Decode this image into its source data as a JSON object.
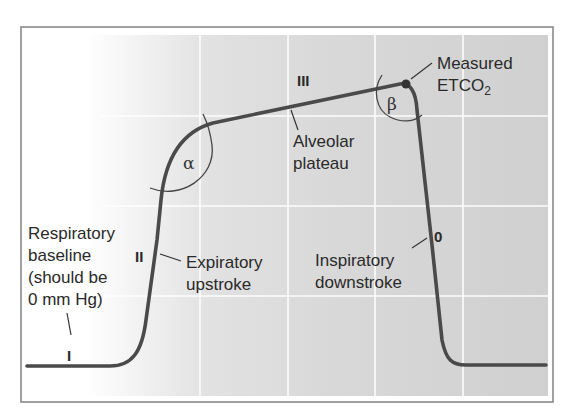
{
  "diagram": {
    "type": "capnogram",
    "colors": {
      "frame_border": "#8a8a8a",
      "background_left": "#ffffff",
      "background_right": "#d2d2d2",
      "gridline": "#ffffff",
      "curve": "#4a4a4a",
      "text": "#2a2a2a"
    },
    "phases": {
      "I": "I",
      "II": "II",
      "III": "III",
      "zero": "0"
    },
    "angles": {
      "alpha": "α",
      "beta": "β"
    },
    "labels": {
      "respiratory_baseline": [
        "Respiratory",
        "baseline",
        "(should be",
        "0 mm Hg)"
      ],
      "expiratory_upstroke": [
        "Expiratory",
        "upstroke"
      ],
      "alveolar_plateau": [
        "Alveolar",
        "plateau"
      ],
      "measured_etco2": {
        "line1": "Measured",
        "line2_main": "ETCO",
        "line2_sub": "2"
      },
      "inspiratory_downstroke": [
        "Inspiratory",
        "downstroke"
      ]
    },
    "grid": {
      "vertical_x": [
        200,
        288,
        375,
        463
      ],
      "horizontal_y": [
        116,
        206,
        296
      ]
    }
  }
}
